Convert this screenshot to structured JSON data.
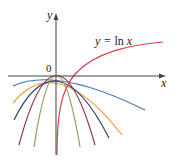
{
  "diagram": {
    "axes": {
      "x_label": "x",
      "y_label": "y",
      "origin_label": "0",
      "axis_color": "#444444"
    },
    "curve_label": {
      "prefix": "y = ",
      "fn": "ln",
      "var": " x"
    },
    "curves": [
      {
        "name": "ln-x",
        "color": "#d9414e"
      },
      {
        "name": "parabola-1",
        "color": "#4a74b8"
      },
      {
        "name": "parabola-2",
        "color": "#e8a33a"
      },
      {
        "name": "parabola-3",
        "color": "#2f3f6e"
      },
      {
        "name": "parabola-4",
        "color": "#8a2d52"
      },
      {
        "name": "parabola-5",
        "color": "#8aa055"
      }
    ]
  }
}
